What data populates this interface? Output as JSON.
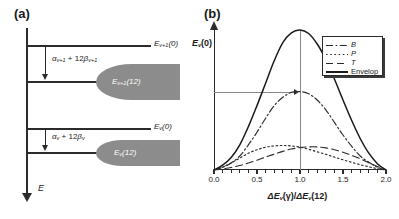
{
  "figure": {
    "panel_a": {
      "label": "(a)",
      "axis_name": "E",
      "axis_direction": "down",
      "levels": [
        {
          "name": "upper-zero-level",
          "label_main": "E",
          "label_sub": "v+1",
          "label_tail": "(0)"
        },
        {
          "name": "upper-twelve-level",
          "label_main": "E",
          "label_sub": "v+1",
          "label_tail": "(12)"
        },
        {
          "name": "lower-zero-level",
          "label_main": "E",
          "label_sub": "v",
          "label_tail": "(0)"
        },
        {
          "name": "lower-twelve-level",
          "label_main": "E",
          "label_sub": "v",
          "label_tail": "(12)"
        }
      ],
      "gap_upper": {
        "alpha": "α",
        "alpha_sub": "v+1",
        "plus": " + 12",
        "beta": "β",
        "beta_sub": "v+1"
      },
      "gap_lower": {
        "alpha": "α",
        "alpha_sub": "v",
        "plus": " + 12",
        "beta": "β",
        "beta_sub": "v"
      },
      "band_color": "#8c8c8c"
    },
    "panel_b": {
      "label": "(b)",
      "ylabel_main": "E",
      "ylabel_sub": "v",
      "ylabel_tail": "(0)",
      "xlabel_d1": "Δ",
      "xlabel_e1": "E",
      "xlabel_sub1": "v",
      "xlabel_g": "(γ)/",
      "xlabel_d2": "Δ",
      "xlabel_e2": "E",
      "xlabel_sub2": "v",
      "xlabel_tail": "(12)"
    }
  },
  "chart_data": {
    "type": "line",
    "title": "",
    "xlabel": "ΔE_v(γ)/ΔE_v(12)",
    "ylabel": "E_v(0)",
    "xlim": [
      0.0,
      2.0
    ],
    "ylim": [
      0.0,
      1.0
    ],
    "xticks": [
      "0.0",
      "0.5",
      "1.0",
      "1.5",
      "2.0"
    ],
    "xtick_values": [
      0.0,
      0.5,
      1.0,
      1.5,
      2.0
    ],
    "yticks": [],
    "grid": false,
    "legend_position": "top-right",
    "annotations": [
      {
        "name": "peak-vertical-reference",
        "type": "vline",
        "x": 1.0,
        "y_from": 0.0,
        "y_to": 1.0,
        "color": "#8a8a8a"
      },
      {
        "name": "b-peak-horizontal-reference",
        "type": "hline",
        "y": 0.56,
        "x_from": 0.0,
        "x_to": 1.0,
        "color": "#8a8a8a",
        "arrow": "right"
      }
    ],
    "x": [
      0.0,
      0.1,
      0.2,
      0.3,
      0.4,
      0.5,
      0.6,
      0.7,
      0.8,
      0.9,
      1.0,
      1.1,
      1.2,
      1.3,
      1.4,
      1.5,
      1.6,
      1.7,
      1.8,
      1.9,
      2.0
    ],
    "series": [
      {
        "name": "B",
        "label": "B",
        "style": "dash-dot",
        "color": "#2b2b2b",
        "peak_x": 1.0,
        "peak_y": 0.56,
        "values": [
          0.0,
          0.02,
          0.05,
          0.1,
          0.18,
          0.27,
          0.37,
          0.46,
          0.52,
          0.555,
          0.56,
          0.545,
          0.5,
          0.43,
          0.34,
          0.25,
          0.17,
          0.1,
          0.055,
          0.02,
          0.0
        ]
      },
      {
        "name": "P",
        "label": "P",
        "style": "dotted",
        "color": "#2b2b2b",
        "peak_x": 0.8,
        "peak_y": 0.175,
        "values": [
          0.0,
          0.02,
          0.05,
          0.085,
          0.12,
          0.145,
          0.163,
          0.172,
          0.175,
          0.172,
          0.163,
          0.148,
          0.13,
          0.112,
          0.092,
          0.073,
          0.055,
          0.038,
          0.023,
          0.01,
          0.0
        ]
      },
      {
        "name": "T",
        "label": "T",
        "style": "dashed",
        "color": "#2b2b2b",
        "peak_x": 1.2,
        "peak_y": 0.165,
        "values": [
          0.0,
          0.008,
          0.018,
          0.032,
          0.05,
          0.07,
          0.092,
          0.113,
          0.133,
          0.15,
          0.16,
          0.165,
          0.165,
          0.158,
          0.145,
          0.127,
          0.105,
          0.08,
          0.052,
          0.025,
          0.0
        ]
      },
      {
        "name": "Envelop",
        "label": "Envelop",
        "style": "solid",
        "color": "#1a1a1a",
        "peak_x": 1.0,
        "peak_y": 1.0,
        "values": [
          0.0,
          0.035,
          0.09,
          0.18,
          0.31,
          0.46,
          0.62,
          0.78,
          0.91,
          0.98,
          1.0,
          0.975,
          0.9,
          0.79,
          0.65,
          0.5,
          0.355,
          0.225,
          0.12,
          0.045,
          0.0
        ]
      }
    ]
  }
}
